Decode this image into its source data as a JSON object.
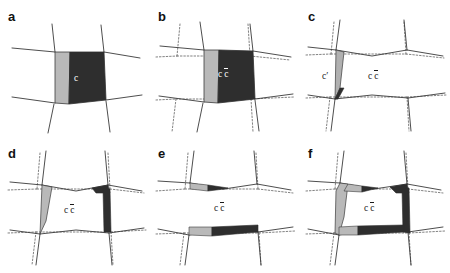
{
  "figure": {
    "type": "multi-panel-geometry-diagram",
    "panel_count": 6,
    "columns": 3,
    "rows": 2,
    "background_color": "#ffffff",
    "line_color": "#3a3a3a",
    "dotted_line_color": "#6b6b6b",
    "fill_dark": "#2e2e2e",
    "fill_gray": "#b9b9b9",
    "fill_white": "#ffffff"
  },
  "panels": [
    {
      "id": "a",
      "label": "a",
      "labels": [
        {
          "text": "c",
          "overline": false,
          "prime": false,
          "on_dark": true,
          "x": 74,
          "y": 78
        }
      ],
      "has_dotted_lines": false,
      "description": "solid cell network with dark central cell and gray left strip"
    },
    {
      "id": "b",
      "label": "b",
      "labels": [
        {
          "text": "c",
          "overline": false,
          "prime": false,
          "on_dark": true,
          "x": 218,
          "y": 74
        },
        {
          "text": "c",
          "overline": true,
          "prime": false,
          "on_dark": true,
          "x": 228,
          "y": 74
        }
      ],
      "has_dotted_lines": true,
      "description": "solid network overlaid with dotted reference network, dark central cell"
    },
    {
      "id": "c",
      "label": "c",
      "labels": [
        {
          "text": "c",
          "overline": false,
          "prime": true,
          "on_dark": false,
          "x": 326,
          "y": 76
        },
        {
          "text": "c",
          "overline": false,
          "prime": false,
          "on_dark": false,
          "x": 372,
          "y": 76
        },
        {
          "text": "c",
          "overline": true,
          "prime": false,
          "on_dark": false,
          "x": 382,
          "y": 76
        }
      ],
      "has_dotted_lines": true,
      "description": "white cells with thin gray and dark slivers along left edge"
    },
    {
      "id": "d",
      "label": "d",
      "labels": [
        {
          "text": "c",
          "overline": false,
          "prime": false,
          "on_dark": false,
          "x": 68,
          "y": 210
        },
        {
          "text": "c",
          "overline": true,
          "prime": false,
          "on_dark": false,
          "x": 78,
          "y": 210
        }
      ],
      "has_dotted_lines": true,
      "description": "gray triangle at left edge, dark wedge top right, dark band right edge"
    },
    {
      "id": "e",
      "label": "e",
      "labels": [
        {
          "text": "c",
          "overline": false,
          "prime": false,
          "on_dark": false,
          "x": 218,
          "y": 208
        },
        {
          "text": "c",
          "overline": true,
          "prime": false,
          "on_dark": false,
          "x": 228,
          "y": 208
        }
      ],
      "has_dotted_lines": true,
      "description": "gray and dark horizontal bands along top and bottom edges"
    },
    {
      "id": "f",
      "label": "f",
      "labels": [
        {
          "text": "c",
          "overline": false,
          "prime": false,
          "on_dark": false,
          "x": 368,
          "y": 208
        },
        {
          "text": "c",
          "overline": true,
          "prime": false,
          "on_dark": false,
          "x": 378,
          "y": 208
        }
      ],
      "has_dotted_lines": true,
      "description": "gray left wedge with dark top, right and bottom bands"
    }
  ]
}
